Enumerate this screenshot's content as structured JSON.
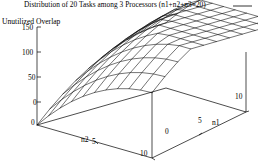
{
  "chart_data": {
    "type": "line",
    "render": "surface-wireframe-3d",
    "title": "Distribution of 20 Tasks among 3 Processors (n1+n2+n3=20)",
    "xlabel": "n2",
    "ylabel": "n1",
    "zlabel": "Unutilized Overlap",
    "grid": false,
    "legend_position": "top-right",
    "legend_entries": [
      {
        "label": "",
        "marker": "line-segment",
        "color": "#000000"
      }
    ],
    "axes": {
      "z": {
        "label": "Unutilized Overlap",
        "ticks": [
          0,
          50,
          100,
          150
        ],
        "tick_labels": [
          "0",
          "50",
          "100",
          "150"
        ],
        "range": [
          0,
          150
        ]
      },
      "x": {
        "label": "n2",
        "ticks": [
          0,
          5,
          10
        ],
        "tick_labels": [
          "0",
          "5",
          "10"
        ],
        "range": [
          0,
          10
        ]
      },
      "y": {
        "label": "n1",
        "ticks": [
          0,
          5,
          10
        ],
        "tick_labels": [
          "0",
          "5",
          "10"
        ],
        "range": [
          0,
          10
        ]
      }
    },
    "surface_mesh": {
      "x_samples": 11,
      "y_samples": 11,
      "x_values": [
        0,
        1,
        2,
        3,
        4,
        5,
        6,
        7,
        8,
        9,
        10
      ],
      "y_values": [
        0,
        1,
        2,
        3,
        4,
        5,
        6,
        7,
        8,
        9,
        10
      ],
      "z_grid": [
        [
          0,
          19,
          36,
          51,
          64,
          75,
          84,
          91,
          96,
          99,
          100
        ],
        [
          19,
          38,
          55,
          70,
          83,
          94,
          103,
          110,
          115,
          118,
          119
        ],
        [
          36,
          55,
          72,
          87,
          100,
          111,
          120,
          127,
          132,
          135,
          136
        ],
        [
          51,
          70,
          87,
          102,
          115,
          126,
          135,
          142,
          147,
          150,
          150
        ],
        [
          64,
          83,
          100,
          115,
          128,
          139,
          148,
          150,
          150,
          150,
          150
        ],
        [
          75,
          94,
          111,
          126,
          139,
          150,
          150,
          150,
          150,
          150,
          150
        ],
        [
          84,
          103,
          120,
          135,
          148,
          150,
          150,
          150,
          150,
          150,
          150
        ],
        [
          91,
          110,
          127,
          142,
          150,
          150,
          150,
          150,
          150,
          150,
          150
        ],
        [
          96,
          115,
          132,
          147,
          150,
          150,
          150,
          150,
          150,
          150,
          150
        ],
        [
          99,
          118,
          135,
          150,
          150,
          150,
          150,
          150,
          150,
          150,
          150
        ],
        [
          100,
          119,
          136,
          150,
          150,
          150,
          150,
          150,
          150,
          150,
          150
        ]
      ],
      "line_color": "#000000"
    }
  },
  "title": {
    "text": "Distribution of 20 Tasks among 3 Processors (n1+n2+n3=20)"
  },
  "labels": {
    "z_axis": "Unutilized Overlap",
    "x_axis": "n2",
    "y_axis": "n1"
  },
  "ticks": {
    "z": {
      "t150": "150",
      "t100": "100",
      "t50": "50",
      "t0": "0"
    },
    "x": {
      "t0": "0",
      "t5": "5",
      "t10": "10"
    },
    "y": {
      "t0": "0",
      "t5": "5",
      "t10": "10"
    }
  },
  "colors": {
    "background": "#ffffff",
    "foreground": "#000000",
    "mesh": "#000000"
  }
}
